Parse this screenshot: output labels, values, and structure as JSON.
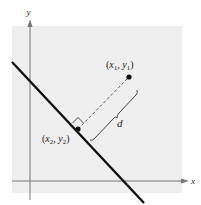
{
  "diagram": {
    "axes": {
      "x_label": "x",
      "y_label": "y"
    },
    "points": [
      {
        "name": "point-1",
        "label_x": "x",
        "sub_x": "1",
        "label_y": "y",
        "sub_y": "1"
      },
      {
        "name": "point-2",
        "label_x": "x",
        "sub_x": "2",
        "label_y": "y",
        "sub_y": "2"
      }
    ],
    "distance_label": "d",
    "colors": {
      "background": "#ffffff",
      "plot_area": "#efefef",
      "axis": "#777777",
      "line": "#111111",
      "dashed": "#444444",
      "text": "#222222"
    }
  }
}
